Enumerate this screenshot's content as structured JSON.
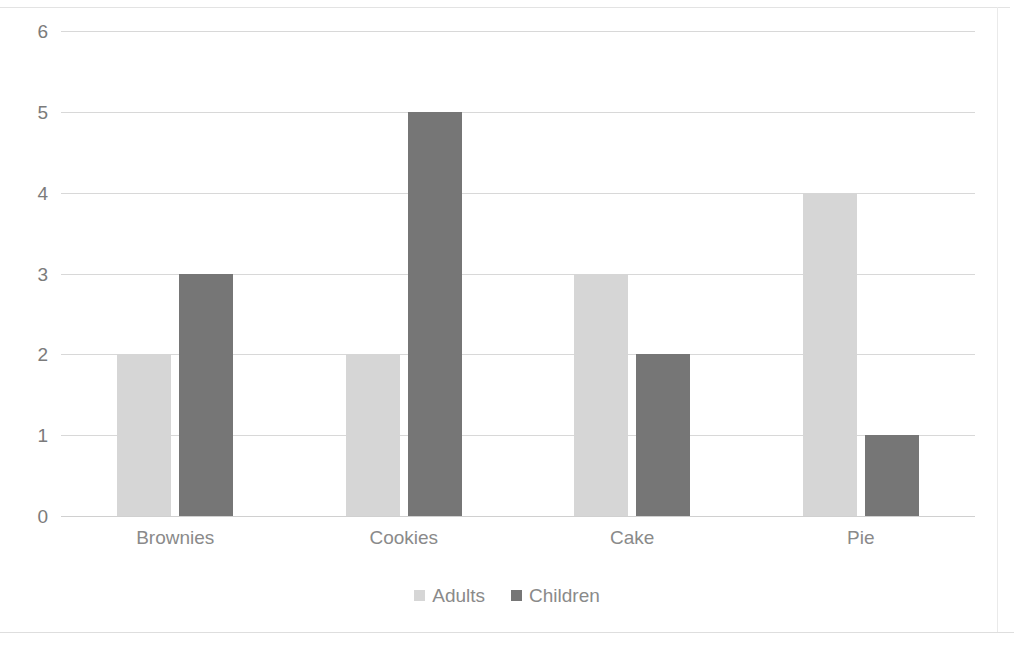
{
  "chart_data": {
    "type": "bar",
    "title": "",
    "subtitle": "",
    "xlabel": "",
    "ylabel": "",
    "categories": [
      "Brownies",
      "Cookies",
      "Cake",
      "Pie"
    ],
    "series": [
      {
        "name": "Adults",
        "color": "#d6d6d6",
        "values": [
          2,
          2,
          3,
          4
        ]
      },
      {
        "name": "Children",
        "color": "#767676",
        "values": [
          3,
          5,
          2,
          1
        ]
      }
    ],
    "ylim": [
      0,
      6
    ],
    "yticks": [
      6,
      5,
      4,
      3,
      2,
      1,
      0
    ],
    "ytick_labels": [
      "6",
      "5",
      "4",
      "3",
      "2",
      "1",
      "0"
    ],
    "grid": true,
    "grid_axis": "y",
    "legend_position": "bottom",
    "annotations": []
  },
  "legend": {
    "entries": [
      {
        "label": "Adults",
        "color": "#d6d6d6"
      },
      {
        "label": "Children",
        "color": "#767676"
      }
    ]
  },
  "colors": {
    "background": "#ffffff",
    "gridline": "#d8d8d8",
    "tick_text": "#7b7b7b",
    "category_text": "#8a8a8a",
    "adults": "#d6d6d6",
    "children": "#767676"
  }
}
